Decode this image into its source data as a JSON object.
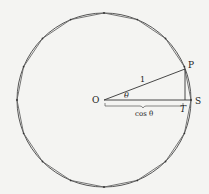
{
  "diagram": {
    "labels": {
      "center": "O",
      "point_p": "P",
      "point_s": "S",
      "point_t": "T",
      "radius": "1",
      "angle": "θ",
      "base": "cos θ"
    },
    "colors": {
      "stroke": "#333333",
      "background": "#f4f4f2",
      "polygon": "#555555"
    },
    "polygon_sides": 16
  }
}
